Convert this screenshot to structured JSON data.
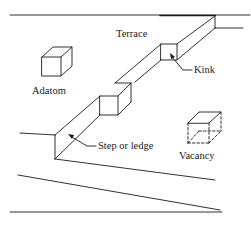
{
  "diagram": {
    "type": "surface-defects-schematic",
    "colors": {
      "line": "#1a1a1a",
      "background": "#ffffff"
    },
    "labels": {
      "terrace": "Terrace",
      "kink": "Kink",
      "adatom": "Adatom",
      "step": "Step or ledge",
      "vacancy": "Vacancy"
    },
    "components": [
      {
        "id": "terrace",
        "label": "Terrace",
        "shape": "flat plane region"
      },
      {
        "id": "kink",
        "label": "Kink",
        "shape": "notch in step edge",
        "arrow": true
      },
      {
        "id": "adatom",
        "label": "Adatom",
        "shape": "solid cube on terrace"
      },
      {
        "id": "step",
        "label": "Step or ledge",
        "shape": "raised edge",
        "arrow": true
      },
      {
        "id": "vacancy",
        "label": "Vacancy",
        "shape": "dashed cube (missing atom)"
      }
    ]
  }
}
